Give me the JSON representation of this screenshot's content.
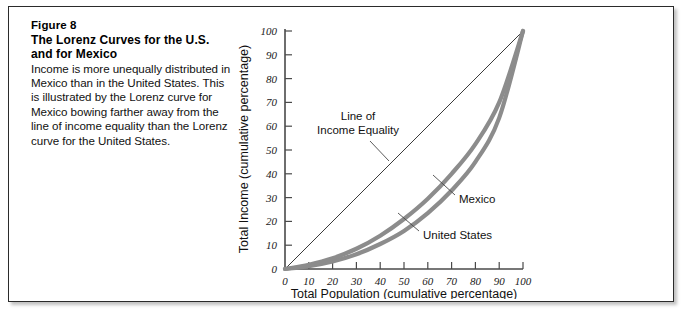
{
  "figure": {
    "number_label": "Figure 8",
    "title_line1": "The Lorenz Curves for the U.S.",
    "title_line2": "and for Mexico",
    "body_text": "Income is more unequally distributed in Mexico than in the United States. This is illustrated by the Lorenz curve for Mexico bowing farther away from the line of income equality than the Lorenz curve for the United States."
  },
  "chart_data": {
    "type": "line",
    "title": "The Lorenz Curves for the U.S. and for Mexico",
    "xlabel": "Total Population (cumulative percentage)",
    "ylabel": "Total Income (cumulative percentage)",
    "xlim": [
      0,
      100
    ],
    "ylim": [
      0,
      100
    ],
    "grid": false,
    "legend_position": "inline-annotations",
    "xticks": [
      "0",
      "10",
      "20",
      "30",
      "40",
      "50",
      "60",
      "70",
      "80",
      "90",
      "100"
    ],
    "yticks": [
      "0",
      "10",
      "20",
      "30",
      "40",
      "50",
      "60",
      "70",
      "80",
      "90",
      "100"
    ],
    "x": [
      0,
      10,
      20,
      30,
      40,
      50,
      60,
      70,
      80,
      90,
      100
    ],
    "series": [
      {
        "name": "Line of Income Equality",
        "values": [
          0,
          10,
          20,
          30,
          40,
          50,
          60,
          70,
          80,
          90,
          100
        ],
        "style": "thin-diagonal"
      },
      {
        "name": "United States",
        "values": [
          0,
          1.8,
          4.5,
          8.5,
          14,
          21,
          29.5,
          40,
          52.5,
          70,
          100
        ],
        "style": "thick-gray"
      },
      {
        "name": "Mexico",
        "values": [
          0,
          1.2,
          3.2,
          6.2,
          10.5,
          16,
          23.5,
          33,
          45,
          63.5,
          100
        ],
        "style": "thick-gray"
      }
    ],
    "annotations": [
      {
        "label_line1": "Line of",
        "label_line2": "Income Equality",
        "target": "equality-line"
      },
      {
        "label_line1": "Mexico",
        "label_line2": "",
        "target": "mexico-curve"
      },
      {
        "label_line1": "United States",
        "label_line2": "",
        "target": "united-states-curve"
      }
    ],
    "colors": {
      "curve": "#8c8c8c",
      "axis": "#4a4a4a",
      "equality": "#3a3a3a"
    }
  }
}
